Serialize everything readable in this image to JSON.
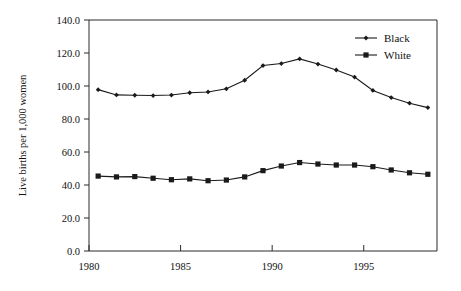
{
  "chart_data": {
    "type": "line",
    "title": "",
    "subtitle": "",
    "xlabel": "",
    "ylabel": "Live births per 1,000 women",
    "x": [
      1980,
      1981,
      1982,
      1983,
      1984,
      1985,
      1986,
      1987,
      1988,
      1989,
      1990,
      1991,
      1992,
      1993,
      1994,
      1995,
      1996,
      1997,
      1998
    ],
    "xlim": [
      1980,
      1999
    ],
    "ylim": [
      0.0,
      140.0
    ],
    "x_ticks": [
      1980,
      1985,
      1990,
      1995
    ],
    "x_tick_labels": [
      "1980",
      "1985",
      "1990",
      "1995"
    ],
    "y_ticks": [
      0.0,
      20.0,
      40.0,
      60.0,
      80.0,
      100.0,
      120.0,
      140.0
    ],
    "y_tick_labels": [
      "0.0",
      "20.0",
      "40.0",
      "60.0",
      "80.0",
      "100.0",
      "120.0",
      "140.0"
    ],
    "grid": false,
    "legend_position": "top-right",
    "series": [
      {
        "name": "Black",
        "marker": "dot",
        "color": "#1a1a1a",
        "values": [
          97.8,
          94.6,
          94.4,
          94.2,
          94.5,
          95.9,
          96.4,
          98.3,
          103.5,
          112.4,
          113.6,
          116.4,
          113.3,
          109.7,
          105.4,
          97.3,
          93.0,
          89.6,
          86.9
        ]
      },
      {
        "name": "White",
        "marker": "square",
        "color": "#1a1a1a",
        "values": [
          45.4,
          44.9,
          45.1,
          44.1,
          43.2,
          43.7,
          42.6,
          43.0,
          44.9,
          48.7,
          51.5,
          53.6,
          52.7,
          52.1,
          52.1,
          51.1,
          49.1,
          47.4,
          46.5
        ]
      }
    ]
  },
  "legend": {
    "entries": [
      {
        "label": "Black",
        "marker": "dot"
      },
      {
        "label": "White",
        "marker": "square"
      }
    ]
  }
}
